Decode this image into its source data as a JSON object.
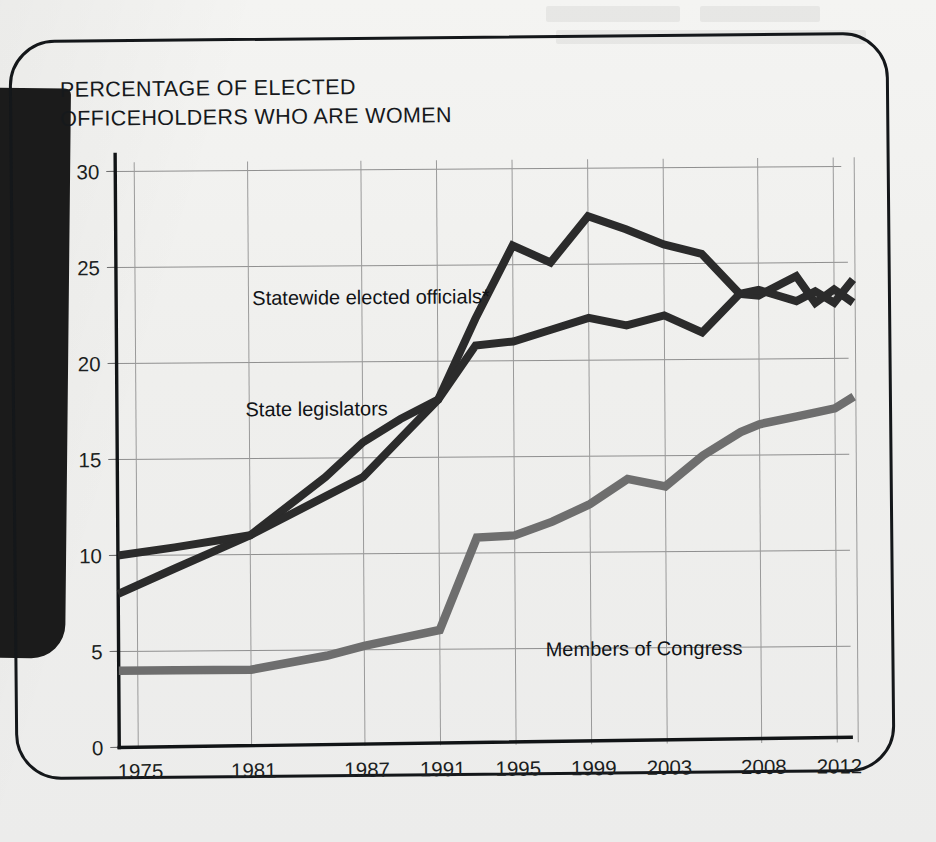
{
  "panel": {
    "title": "PERCENTAGE OF ELECTED\nOFFICEHOLDERS WHO ARE WOMEN"
  },
  "chart_data": {
    "type": "line",
    "title": "PERCENTAGE OF ELECTED OFFICEHOLDERS WHO ARE WOMEN",
    "xlabel": "",
    "ylabel": "",
    "ylim": [
      0,
      30
    ],
    "yticks": [
      "0",
      "5",
      "10",
      "15",
      "20",
      "25",
      "30"
    ],
    "ytick_values": [
      0,
      5,
      10,
      15,
      20,
      25,
      30
    ],
    "xticks": [
      "1975",
      "1981",
      "1987",
      "1991",
      "1995",
      "1999",
      "2003",
      "2008",
      "2012"
    ],
    "xtick_values": [
      1975,
      1981,
      1987,
      1991,
      1995,
      1999,
      2003,
      2008,
      2012
    ],
    "xlim": [
      1974,
      2014
    ],
    "grid": true,
    "legend": "inline-labels",
    "series": [
      {
        "name": "Statewide elected officials*",
        "color": "#2b2b2b",
        "label_x": 1981.2,
        "label_y": 23.0,
        "x": [
          1974,
          1977,
          1981,
          1985,
          1987,
          1989,
          1991,
          1993,
          1995,
          1997,
          1999,
          2001,
          2003,
          2005,
          2007,
          2008,
          2010,
          2011,
          2012,
          2013
        ],
        "y": [
          8.0,
          9.3,
          11.0,
          14.0,
          15.8,
          17.0,
          18.0,
          22.2,
          26.0,
          25.1,
          27.5,
          26.8,
          26.0,
          25.5,
          23.4,
          23.3,
          24.3,
          22.9,
          23.6,
          22.9
        ]
      },
      {
        "name": "State legislators",
        "color": "#2b2b2b",
        "label_x": 1980.8,
        "label_y": 17.2,
        "x": [
          1974,
          1977,
          1981,
          1985,
          1987,
          1989,
          1991,
          1993,
          1995,
          1997,
          1999,
          2001,
          2003,
          2005,
          2007,
          2008,
          2010,
          2011,
          2012,
          2013
        ],
        "y": [
          10.0,
          10.4,
          11.0,
          13.0,
          14.0,
          16.0,
          18.0,
          20.8,
          21.0,
          21.6,
          22.2,
          21.8,
          22.3,
          21.4,
          23.4,
          23.6,
          23.0,
          23.5,
          22.9,
          24.1
        ]
      },
      {
        "name": "Members of Congress",
        "color": "#6e6e6e",
        "label_x": 1996.6,
        "label_y": 4.6,
        "x": [
          1974,
          1977,
          1981,
          1985,
          1987,
          1989,
          1991,
          1993,
          1995,
          1997,
          1999,
          2001,
          2003,
          2005,
          2007,
          2008,
          2010,
          2011,
          2012,
          2013
        ],
        "y": [
          4.0,
          4.0,
          4.0,
          4.7,
          5.2,
          5.6,
          6.0,
          10.8,
          10.9,
          11.6,
          12.5,
          13.8,
          13.4,
          15.0,
          16.2,
          16.6,
          17.0,
          17.2,
          17.4,
          18.0
        ]
      }
    ]
  }
}
